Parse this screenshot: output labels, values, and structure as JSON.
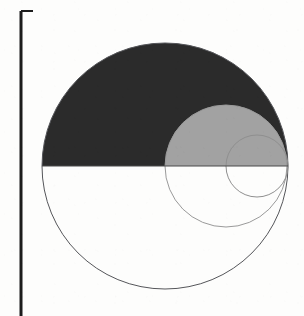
{
  "figure": {
    "background_color": "#fdfdfc",
    "canvas": {
      "width": 304,
      "height": 316
    },
    "margin_rule": {
      "name": "left-margin-rule",
      "color": "#1c1c1c",
      "x": 21,
      "y_top": 11,
      "y_bottom": 316,
      "thickness": 3,
      "tick": {
        "name": "top-tick",
        "x_start": 21,
        "x_end": 33,
        "y": 11,
        "thickness": 2
      }
    },
    "shapes": [
      {
        "id": "large-circle",
        "label": "Large circle",
        "cx": 165,
        "cy": 166,
        "r": 123,
        "outline_color": "#55565a",
        "outline_width": 1,
        "upper_half_fill": "#2b2b2b",
        "lower_half_fill": "none"
      },
      {
        "id": "medium-circle",
        "label": "Medium circle",
        "cx": 226,
        "cy": 166,
        "r": 61,
        "outline_color": "#9a9a9a",
        "outline_width": 1,
        "upper_half_fill": "#a2a2a2",
        "lower_half_fill": "none"
      },
      {
        "id": "small-circle",
        "label": "Small circle",
        "cx": 257,
        "cy": 166,
        "r": 31,
        "outline_color": "#8f8f8f",
        "outline_width": 1,
        "upper_half_fill": "none",
        "lower_half_fill": "none"
      }
    ],
    "diameter_line": {
      "name": "horizontal-diameter",
      "y": 166,
      "x_start": 42,
      "x_end": 288,
      "color": "#4a4a4a",
      "width": 1
    }
  },
  "chart_data": {
    "type": "scatter",
    "xlabel": "",
    "ylabel": "",
    "grid": false,
    "legend": "none",
    "xlim": [
      0,
      304
    ],
    "ylim": [
      0,
      316
    ],
    "series": [
      {
        "name": "Large circle",
        "cx": 165,
        "cy": 166,
        "r": 123,
        "fill_upper": "#2b2b2b",
        "stroke": "#55565a"
      },
      {
        "name": "Medium circle",
        "cx": 226,
        "cy": 166,
        "r": 61,
        "fill_upper": "#a2a2a2",
        "stroke": "#9a9a9a"
      },
      {
        "name": "Small circle",
        "cx": 257,
        "cy": 166,
        "r": 31,
        "fill_upper": "none",
        "stroke": "#8f8f8f"
      }
    ],
    "annotations": [
      {
        "name": "left-margin-rule",
        "x": 21,
        "y1": 11,
        "y2": 316
      },
      {
        "name": "top-tick",
        "x1": 21,
        "x2": 33,
        "y": 11
      }
    ]
  }
}
